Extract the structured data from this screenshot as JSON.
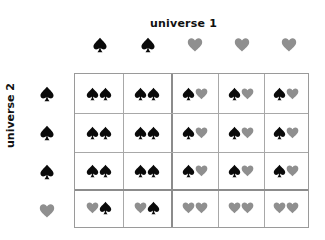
{
  "labels": {
    "top_title": "universe 1",
    "left_title": "universe 2"
  },
  "colors": {
    "spade": "#0a0a0a",
    "heart": "#8f8f8f",
    "grid": "#a8a8a8",
    "grid_thick": "#8c8c8c"
  },
  "columns": [
    "spade",
    "spade",
    "heart",
    "heart",
    "heart"
  ],
  "rows": [
    "spade",
    "spade",
    "spade",
    "heart"
  ],
  "cells": [
    [
      [
        "spade",
        "spade"
      ],
      [
        "spade",
        "spade"
      ],
      [
        "spade",
        "heart"
      ],
      [
        "spade",
        "heart"
      ],
      [
        "spade",
        "heart"
      ]
    ],
    [
      [
        "spade",
        "spade"
      ],
      [
        "spade",
        "spade"
      ],
      [
        "spade",
        "heart"
      ],
      [
        "spade",
        "heart"
      ],
      [
        "spade",
        "heart"
      ]
    ],
    [
      [
        "spade",
        "spade"
      ],
      [
        "spade",
        "spade"
      ],
      [
        "spade",
        "heart"
      ],
      [
        "spade",
        "heart"
      ],
      [
        "spade",
        "heart"
      ]
    ],
    [
      [
        "heart",
        "spade"
      ],
      [
        "heart",
        "spade"
      ],
      [
        "heart",
        "heart"
      ],
      [
        "heart",
        "heart"
      ],
      [
        "heart",
        "heart"
      ]
    ]
  ]
}
